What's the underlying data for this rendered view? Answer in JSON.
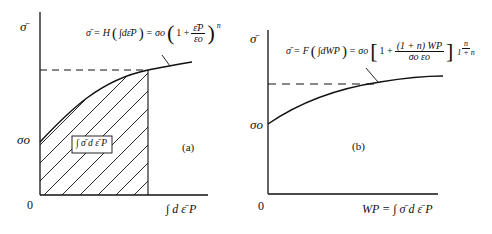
{
  "figure": {
    "panel_a": {
      "label": "(a)",
      "y_axis_label": "σ̄",
      "y_tick_label": "σo",
      "origin_label": "0",
      "x_axis_label": "∫ d ε̄ P",
      "equation": {
        "lhs": "σ̄ = H",
        "integral": "∫dε̄P",
        "mid": "= σo",
        "bracket_inner_1": "1 +",
        "frac_num": "ε̄P",
        "frac_den": "εo",
        "exponent": "n"
      },
      "area_label": "∫ σ̄ d ε̄ P"
    },
    "panel_b": {
      "label": "(b)",
      "y_axis_label": "σ̄",
      "y_tick_label": "σo",
      "origin_label": "0",
      "x_axis_label": "WP = ∫ σ̄ d ε̄ P",
      "equation": {
        "lhs": "σ̄ = F",
        "integral": "∫dWP",
        "mid": "= σo",
        "bracket_inner_1": "1 +",
        "frac_num": "(1 + n) WP",
        "frac_den": "σo εo",
        "exp_num": "n",
        "exp_den": "1 + n"
      }
    }
  },
  "colors": {
    "ink": "#111111",
    "background": "#ffffff"
  }
}
